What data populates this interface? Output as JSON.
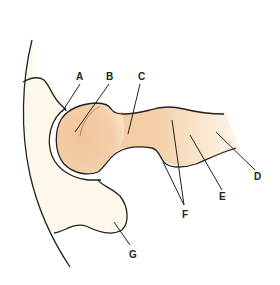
{
  "diagram": {
    "colors": {
      "femur_head": "#f2c9a0",
      "femur_light": "#f9e2c8",
      "pelvis": "#fdf8ea",
      "outline": "#222222",
      "background": "#ffffff"
    },
    "labels": [
      {
        "id": "A",
        "text": "A",
        "x": 77,
        "y": 69
      },
      {
        "id": "B",
        "text": "B",
        "x": 107,
        "y": 69
      },
      {
        "id": "C",
        "text": "C",
        "x": 139,
        "y": 69
      },
      {
        "id": "D",
        "text": "D",
        "x": 253,
        "y": 172
      },
      {
        "id": "E",
        "text": "E",
        "x": 221,
        "y": 192
      },
      {
        "id": "F",
        "text": "F",
        "x": 183,
        "y": 211
      },
      {
        "id": "G",
        "text": "G",
        "x": 130,
        "y": 252
      }
    ]
  }
}
